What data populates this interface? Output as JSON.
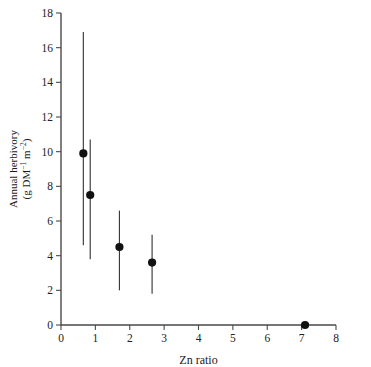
{
  "chart_data": {
    "type": "scatter",
    "title": "",
    "xlabel": "Zn ratio",
    "ylabel_line1": "Annual herbivory",
    "ylabel_line2_prefix": "(g DM",
    "ylabel_line2_sup1": "−1",
    "ylabel_line2_mid": " m",
    "ylabel_line2_sup2": "−2",
    "ylabel_line2_suffix": ")",
    "ylabel": "Annual herbivory (g DM−1 m−2)",
    "xlim": [
      0,
      8
    ],
    "ylim": [
      0,
      18
    ],
    "xticks": [
      0,
      1,
      2,
      3,
      4,
      5,
      6,
      7,
      8
    ],
    "xtick_labels": [
      "0",
      "1",
      "2",
      "3",
      "4",
      "5",
      "6",
      "7",
      "8"
    ],
    "yticks": [
      0,
      2,
      4,
      6,
      8,
      10,
      12,
      14,
      16,
      18
    ],
    "ytick_labels": [
      "0",
      "2",
      "4",
      "6",
      "8",
      "10",
      "12",
      "14",
      "16",
      "18"
    ],
    "grid": false,
    "legend": false,
    "marker_color": "#111111",
    "errorbar_color": "#3a3a3a",
    "axis_color": "#4a4a4a",
    "error_style": "vertical-line-no-caps",
    "points": [
      {
        "x": 0.65,
        "y": 9.9,
        "y_low": 4.6,
        "y_high": 16.9
      },
      {
        "x": 0.85,
        "y": 7.5,
        "y_low": 3.8,
        "y_high": 10.7
      },
      {
        "x": 1.7,
        "y": 4.5,
        "y_low": 2.0,
        "y_high": 6.6
      },
      {
        "x": 2.65,
        "y": 3.6,
        "y_low": 1.8,
        "y_high": 5.2
      },
      {
        "x": 7.1,
        "y": 0.0,
        "y_low": 0.0,
        "y_high": 0.0
      }
    ]
  }
}
